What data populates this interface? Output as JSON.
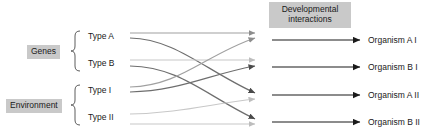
{
  "diagram": {
    "type": "flow-diagram",
    "header": {
      "line1": "Developmental",
      "line2": "interactions"
    },
    "groups": [
      {
        "name": "Genes",
        "label": "Genes",
        "members": [
          "Type A",
          "Type B"
        ]
      },
      {
        "name": "Environment",
        "label": "Environment",
        "members": [
          "Type I",
          "Type II"
        ]
      }
    ],
    "inputs": [
      {
        "id": "typeA",
        "label": "Type A",
        "y": 36
      },
      {
        "id": "typeB",
        "label": "Type B",
        "y": 63
      },
      {
        "id": "typeI",
        "label": "Type I",
        "y": 90
      },
      {
        "id": "typeII",
        "label": "Type II",
        "y": 117
      }
    ],
    "outputs": [
      {
        "id": "orgAI",
        "label": "Organism A I",
        "y": 40
      },
      {
        "id": "orgBI",
        "label": "Organism B I",
        "y": 67
      },
      {
        "id": "orgAII",
        "label": "Organism A II",
        "y": 95
      },
      {
        "id": "orgBII",
        "label": "Organism B II",
        "y": 122
      }
    ],
    "colors": {
      "chip_background": "#c9c9c9",
      "text": "#1a1a1a",
      "output_arrow": "#1a1a1a",
      "link_dark": "#6e6e6e",
      "link_mid": "#a0a0a0",
      "link_light": "#c8c8c8"
    },
    "links": [
      {
        "from": "Type A",
        "to": "Organism A I",
        "shade": "mid"
      },
      {
        "from": "Type A",
        "to": "Organism A II",
        "shade": "dark"
      },
      {
        "from": "Type B",
        "to": "Organism B I",
        "shade": "light"
      },
      {
        "from": "Type B",
        "to": "Organism B II",
        "shade": "dark"
      },
      {
        "from": "Type I",
        "to": "Organism A I",
        "shade": "mid"
      },
      {
        "from": "Type I",
        "to": "Organism B I",
        "shade": "dark"
      },
      {
        "from": "Type II",
        "to": "Organism A II",
        "shade": "light"
      },
      {
        "from": "Type II",
        "to": "Organism B II",
        "shade": "light"
      }
    ]
  }
}
